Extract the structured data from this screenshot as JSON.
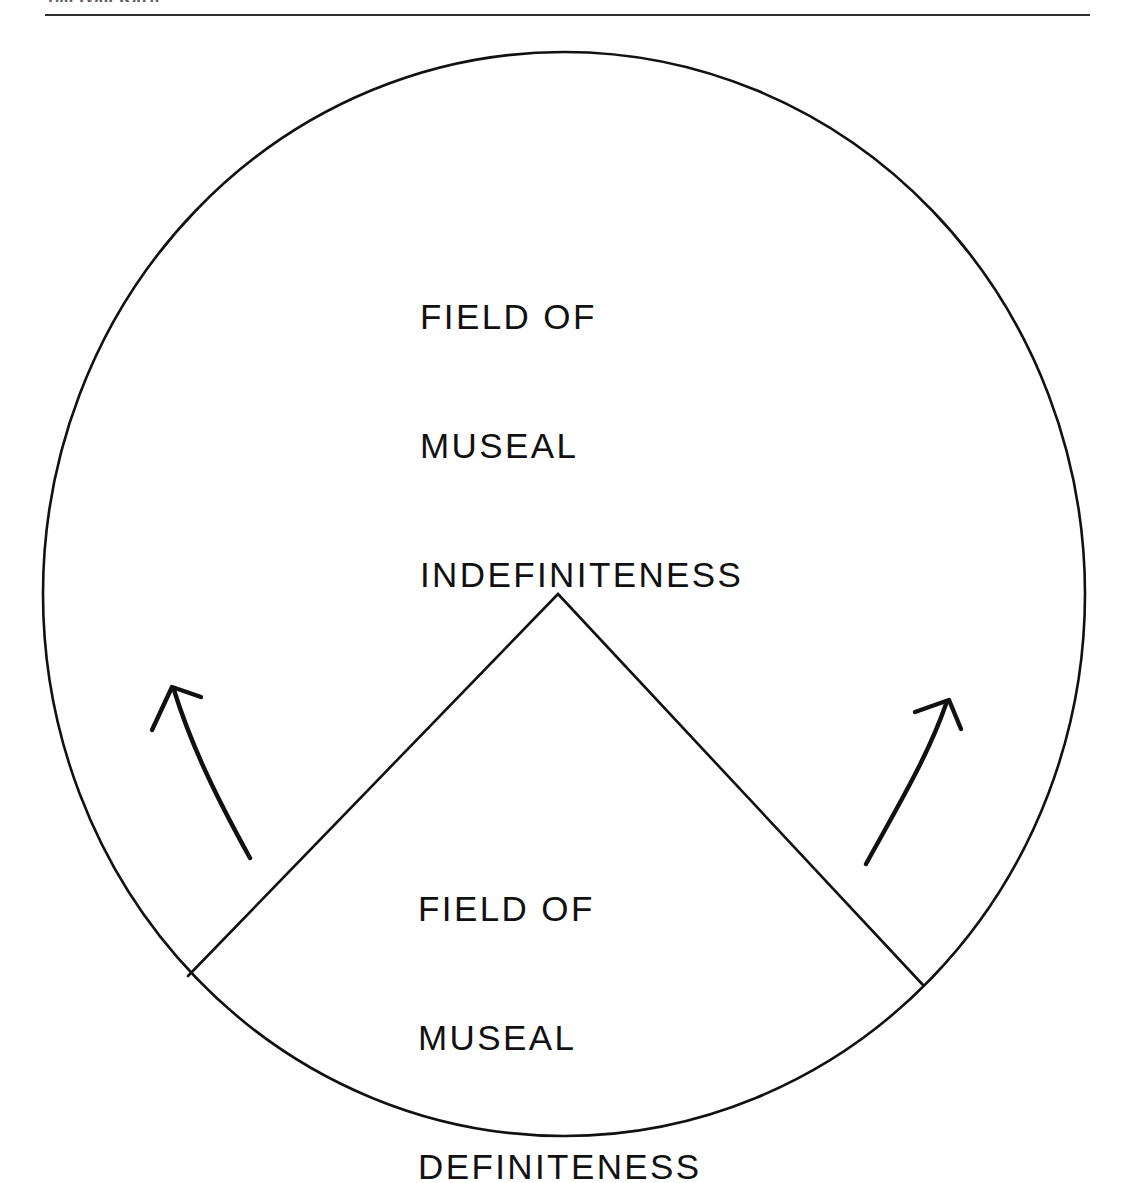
{
  "page": {
    "header_text": "108  Ivan Karp",
    "width": 1124,
    "height": 1169,
    "background_color": "#ffffff",
    "ink_color": "#111111",
    "rule_color": "#2e2e2e"
  },
  "figure": {
    "name": "museal-field-diagram",
    "circle": {
      "label": "outer-circle",
      "center_x": 564,
      "center_y": 594,
      "radius_x": 521,
      "radius_y": 542,
      "stroke_width": 2.6
    },
    "wedge": {
      "label": "definiteness-wedge",
      "apex_x": 558,
      "apex_y": 594,
      "left_x": 188,
      "left_y": 976,
      "right_x": 923,
      "right_y": 985,
      "stroke_width": 2.6
    },
    "arrows": [
      {
        "name": "left-upward-arrow",
        "direction": "up-left",
        "tail_x": 250,
        "tail_y": 858,
        "tip_x": 170,
        "tip_y": 686
      },
      {
        "name": "right-upward-arrow",
        "direction": "up-right",
        "tail_x": 866,
        "tail_y": 864,
        "tip_x": 950,
        "tip_y": 700
      }
    ],
    "labels": {
      "indefiniteness": {
        "name": "field-of-museal-indefiniteness",
        "lines": [
          "FIELD OF",
          "MUSEAL",
          "INDEFINITENESS"
        ],
        "full_text": "FIELD OF MUSEAL INDEFINITENESS",
        "x": 420,
        "y": 209
      },
      "definiteness": {
        "name": "field-of-museal-definiteness",
        "lines": [
          "FIELD OF",
          "MUSEAL",
          "DEFINITENESS"
        ],
        "full_text": "FIELD OF MUSEAL DEFINITENESS",
        "x": 418,
        "y": 801
      }
    }
  }
}
